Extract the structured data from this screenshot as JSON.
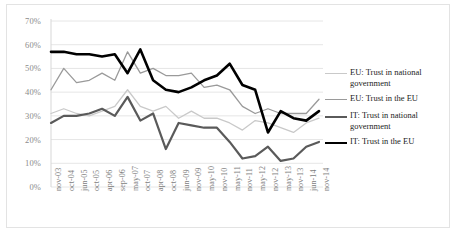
{
  "chart_data": {
    "type": "line",
    "title": "",
    "xlabel": "",
    "ylabel": "",
    "ylim": [
      0,
      70
    ],
    "ytick_labels": [
      "0%",
      "10%",
      "20%",
      "30%",
      "40%",
      "50%",
      "60%",
      "70%"
    ],
    "ytick_values": [
      0,
      10,
      20,
      30,
      40,
      50,
      60,
      70
    ],
    "grid": true,
    "legend_position": "right",
    "categories": [
      "nov-03",
      "oct-04",
      "jun-05",
      "oct-05",
      "apr-06",
      "sep-06",
      "may-07",
      "oct-07",
      "apr-08",
      "oct-08",
      "jun-09",
      "nov-09",
      "may-10",
      "nov-10",
      "may-11",
      "nov-11",
      "may-12",
      "nov-12",
      "may-13",
      "nov-13",
      "jun-14",
      "nov-14"
    ],
    "series": [
      {
        "name": "EU: Trust in national government",
        "key": "eu_national",
        "color": "#c9c9c9",
        "width": 1.3,
        "values": [
          31,
          33,
          31,
          30,
          32,
          34,
          41,
          34,
          32,
          34,
          29,
          32,
          29,
          29,
          27,
          24,
          28,
          27,
          25,
          23,
          27,
          29
        ]
      },
      {
        "name": "EU: Trust in the EU",
        "key": "eu_eu",
        "color": "#9a9a9a",
        "width": 1.3,
        "values": [
          41,
          50,
          44,
          45,
          48,
          45,
          57,
          48,
          50,
          47,
          47,
          48,
          42,
          43,
          41,
          34,
          31,
          33,
          31,
          31,
          31,
          37
        ]
      },
      {
        "name": "IT: Trust in national government",
        "key": "it_national",
        "color": "#5a5a5a",
        "width": 2.2,
        "values": [
          27,
          30,
          30,
          31,
          33,
          30,
          38,
          28,
          31,
          16,
          27,
          26,
          25,
          25,
          19,
          12,
          13,
          17,
          11,
          12,
          17,
          19
        ]
      },
      {
        "name": "IT: Trust in the EU",
        "key": "it_eu",
        "color": "#000000",
        "width": 2.6,
        "values": [
          57,
          57,
          56,
          56,
          55,
          56,
          48,
          58,
          45,
          41,
          40,
          42,
          45,
          47,
          52,
          43,
          41,
          23,
          32,
          29,
          28,
          32
        ]
      }
    ]
  }
}
